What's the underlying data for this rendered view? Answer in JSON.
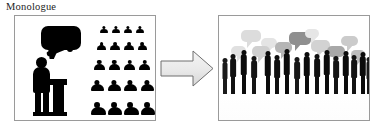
{
  "caption": {
    "text": "Monologue"
  },
  "colors": {
    "panel_border": "#9a9a9a",
    "figure_black": "#000000",
    "arrow_fill": "#e8e8e8",
    "arrow_stroke": "#6f6f6f",
    "bubble_gray_dark": "#8f8f8f",
    "bubble_gray_mid": "#bdbdbd",
    "bubble_gray_light": "#dcdcdc",
    "background": "#ffffff"
  },
  "panels": [
    {
      "id": "left",
      "name": "monologue-panel",
      "alt": "One speaker at a podium with a single filled speech bubble addressing a silent seated audience",
      "speaker": {
        "name": "speaker-figure",
        "has_speech_bubble": true,
        "bubble_count": 1,
        "at_podium": true,
        "arm_raised": true
      },
      "audience": {
        "name": "audience-grid",
        "rows": 5,
        "columns": 4,
        "total_people": 20,
        "speech_bubbles": 0
      }
    },
    {
      "id": "right",
      "name": "dialogue-panel",
      "alt": "A crowd of people standing in small conversational groups, many overlapping gray speech bubbles above them, with soft reflections on the floor",
      "crowd": {
        "name": "crowd-silhouettes",
        "figure_count": 16,
        "groups": 5,
        "speech_bubbles": 11,
        "has_reflections": true
      }
    }
  ],
  "arrow": {
    "name": "transition-arrow",
    "direction": "right",
    "label": ""
  },
  "audience_rows": [
    {
      "count": 4,
      "scale": 0.62,
      "top": 0,
      "gap": 4
    },
    {
      "count": 4,
      "scale": 0.74,
      "top": 16,
      "gap": 4
    },
    {
      "count": 4,
      "scale": 0.86,
      "top": 34,
      "gap": 4
    },
    {
      "count": 4,
      "scale": 1.0,
      "top": 54,
      "gap": 4
    },
    {
      "count": 4,
      "scale": 1.14,
      "top": 76,
      "gap": 4
    }
  ],
  "crowd_bubbles": [
    {
      "x": 22,
      "y": 14,
      "w": 20,
      "h": 12,
      "tone": "#dcdcdc"
    },
    {
      "x": 42,
      "y": 22,
      "w": 16,
      "h": 10,
      "tone": "#e4e4e4"
    },
    {
      "x": 33,
      "y": 30,
      "w": 18,
      "h": 11,
      "tone": "#cfcfcf"
    },
    {
      "x": 56,
      "y": 26,
      "w": 17,
      "h": 11,
      "tone": "#b5b5b5"
    },
    {
      "x": 70,
      "y": 16,
      "w": 22,
      "h": 13,
      "tone": "#8f8f8f"
    },
    {
      "x": 92,
      "y": 24,
      "w": 19,
      "h": 12,
      "tone": "#d2d2d2"
    },
    {
      "x": 12,
      "y": 30,
      "w": 15,
      "h": 10,
      "tone": "#e0e0e0"
    },
    {
      "x": 86,
      "y": 13,
      "w": 14,
      "h": 9,
      "tone": "#e6e6e6"
    },
    {
      "x": 108,
      "y": 30,
      "w": 18,
      "h": 11,
      "tone": "#a8a8a8"
    },
    {
      "x": 122,
      "y": 20,
      "w": 17,
      "h": 10,
      "tone": "#cbcbcb"
    },
    {
      "x": 132,
      "y": 34,
      "w": 14,
      "h": 9,
      "tone": "#bdbdbd"
    }
  ],
  "crowd_figures": [
    {
      "x": 10,
      "h": 40,
      "w": 8,
      "tone": "#111111"
    },
    {
      "x": 20,
      "h": 44,
      "w": 9,
      "tone": "#0b0b0b"
    },
    {
      "x": 31,
      "h": 38,
      "w": 8,
      "tone": "#151515"
    },
    {
      "x": 44,
      "h": 43,
      "w": 9,
      "tone": "#0b0b0b"
    },
    {
      "x": 54,
      "h": 39,
      "w": 8,
      "tone": "#101010"
    },
    {
      "x": 63,
      "h": 45,
      "w": 9,
      "tone": "#0b0b0b"
    },
    {
      "x": 74,
      "h": 37,
      "w": 8,
      "tone": "#171717"
    },
    {
      "x": 83,
      "h": 42,
      "w": 9,
      "tone": "#0b0b0b"
    },
    {
      "x": 94,
      "h": 40,
      "w": 8,
      "tone": "#101010"
    },
    {
      "x": 103,
      "h": 44,
      "w": 9,
      "tone": "#0b0b0b"
    },
    {
      "x": 113,
      "h": 38,
      "w": 8,
      "tone": "#141414"
    },
    {
      "x": 122,
      "h": 43,
      "w": 9,
      "tone": "#0b0b0b"
    },
    {
      "x": 131,
      "h": 39,
      "w": 8,
      "tone": "#121212"
    },
    {
      "x": 139,
      "h": 42,
      "w": 9,
      "tone": "#0b0b0b"
    },
    {
      "x": 2,
      "h": 36,
      "w": 7,
      "tone": "#1a1a1a"
    },
    {
      "x": 146,
      "h": 37,
      "w": 7,
      "tone": "#191919"
    }
  ]
}
